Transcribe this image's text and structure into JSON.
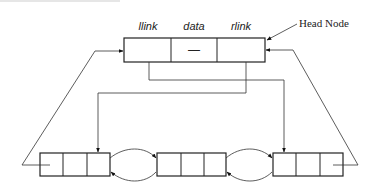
{
  "diagram": {
    "head_node": {
      "callout_label": "Head Node",
      "fields": [
        {
          "name": "llink",
          "label": "llink",
          "value": ""
        },
        {
          "name": "data",
          "label": "data",
          "value": "—"
        },
        {
          "name": "rlink",
          "label": "rlink",
          "value": ""
        }
      ]
    },
    "list_nodes": [
      {
        "id": "node-1",
        "cells": [
          "",
          "",
          ""
        ]
      },
      {
        "id": "node-2",
        "cells": [
          "",
          "",
          ""
        ]
      },
      {
        "id": "node-3",
        "cells": [
          "",
          "",
          ""
        ]
      }
    ],
    "edges": [
      {
        "from": "head.llink",
        "to": "node-3",
        "kind": "pointer"
      },
      {
        "from": "head.rlink",
        "to": "node-1",
        "kind": "pointer"
      },
      {
        "from": "node-1.rlink",
        "to": "node-2",
        "kind": "pointer"
      },
      {
        "from": "node-2.llink",
        "to": "node-1",
        "kind": "pointer"
      },
      {
        "from": "node-2.rlink",
        "to": "node-3",
        "kind": "pointer"
      },
      {
        "from": "node-3.llink",
        "to": "node-2",
        "kind": "pointer"
      },
      {
        "from": "node-1.llink",
        "to": "head",
        "kind": "pointer"
      },
      {
        "from": "node-3.rlink",
        "to": "head",
        "kind": "pointer"
      }
    ],
    "colors": {
      "line": "#222222",
      "background": "#ffffff"
    }
  }
}
